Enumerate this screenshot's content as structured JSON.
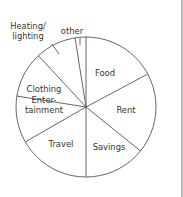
{
  "chart_data": {
    "type": "pie",
    "title": "",
    "start_angle": "12 o'clock",
    "direction": "clockwise",
    "slices": [
      {
        "label": "Food",
        "label_lines": [
          "Food"
        ],
        "value": 17.2
      },
      {
        "label": "Rent",
        "label_lines": [
          "Rent"
        ],
        "value": 18.6
      },
      {
        "label": "Savings",
        "label_lines": [
          "Savings"
        ],
        "value": 14.2
      },
      {
        "label": "Travel",
        "label_lines": [
          "Travel"
        ],
        "value": 16.7
      },
      {
        "label": "Entertainment",
        "label_lines": [
          "Enter-",
          "tainment"
        ],
        "value": 10.8
      },
      {
        "label": "Clothing",
        "label_lines": [
          "Clothing"
        ],
        "value": 10.6
      },
      {
        "label": "Heating/ lighting",
        "label_lines": [
          "Heating/",
          "lighting"
        ],
        "value": 9.4,
        "label_outside": true
      },
      {
        "label": "other",
        "label_lines": [
          "other"
        ],
        "value": 2.5,
        "label_outside": true
      }
    ],
    "units": "percent of total (estimated from slice angles)",
    "legend": "none",
    "colors": {
      "line": "#555555",
      "fill": "#ffffff",
      "text": "#333333"
    }
  }
}
